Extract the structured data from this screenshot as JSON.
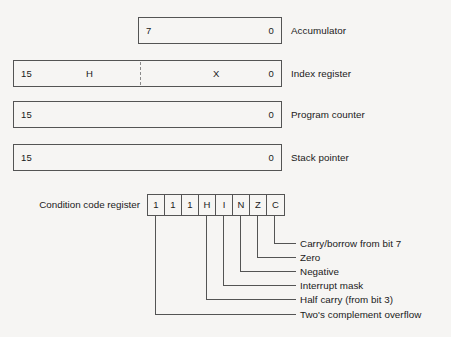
{
  "diagram": {
    "background_color": "#f6f5f3",
    "line_color": "#545454",
    "text_color": "#1a1a1a"
  },
  "registers": [
    {
      "name": "Accumulator",
      "msb": "7",
      "lsb": "0",
      "mid_labels": [],
      "has_dashed_divider": false
    },
    {
      "name": "Index register",
      "msb": "15",
      "lsb": "0",
      "mid_labels": [
        "H",
        "X"
      ],
      "has_dashed_divider": true
    },
    {
      "name": "Program counter",
      "msb": "15",
      "lsb": "0",
      "mid_labels": [],
      "has_dashed_divider": false
    },
    {
      "name": "Stack pointer",
      "msb": "15",
      "lsb": "0",
      "mid_labels": [],
      "has_dashed_divider": false
    }
  ],
  "condition_code_register": {
    "label": "Condition code register",
    "bits": [
      "1",
      "1",
      "1",
      "H",
      "I",
      "N",
      "Z",
      "C"
    ]
  },
  "callouts": [
    {
      "bit": "C",
      "text": "Carry/borrow from bit 7"
    },
    {
      "bit": "Z",
      "text": "Zero"
    },
    {
      "bit": "N",
      "text": "Negative"
    },
    {
      "bit": "I",
      "text": "Interrupt mask"
    },
    {
      "bit": "H",
      "text": "Half carry (from bit 3)"
    },
    {
      "bit": "1",
      "text": "Two's complement overflow"
    }
  ]
}
